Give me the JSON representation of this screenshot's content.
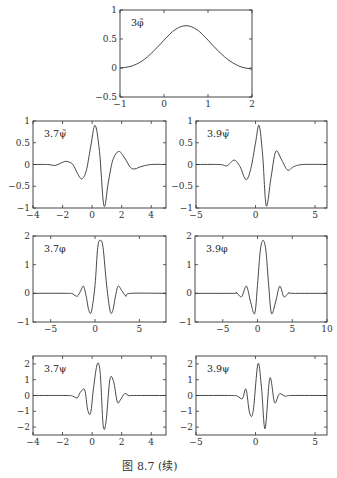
{
  "caption": "图 8.7   (续)",
  "chart_data": [
    {
      "id": "p1",
      "type": "line",
      "label": "3φ̃",
      "frame": [
        120,
        10,
        252,
        97
      ],
      "xlim": [
        -1,
        2
      ],
      "ylim": [
        -0.5,
        1
      ],
      "xticks": [
        -1,
        0,
        1,
        2
      ],
      "xticklabels": [
        "−1",
        "0",
        "1",
        "2"
      ],
      "yticks": [
        -0.5,
        0,
        0.5,
        1
      ],
      "yticklabels": [
        "−0.5",
        "0",
        "0.5",
        "1"
      ],
      "x": [
        -1,
        -0.75,
        -0.5,
        -0.25,
        0,
        0.25,
        0.5,
        0.75,
        1,
        1.25,
        1.5,
        1.75,
        2
      ],
      "y": [
        0,
        0.03,
        0.12,
        0.28,
        0.48,
        0.66,
        0.73,
        0.66,
        0.48,
        0.28,
        0.12,
        0.02,
        -0.02
      ]
    },
    {
      "id": "p2",
      "type": "line",
      "label": "3.7ψ̃",
      "frame": [
        33,
        121,
        166,
        208
      ],
      "xlim": [
        -4,
        5
      ],
      "ylim": [
        -1,
        1
      ],
      "xticks": [
        -4,
        -2,
        0,
        2,
        4
      ],
      "xticklabels": [
        "−4",
        "−2",
        "0",
        "2",
        "4"
      ],
      "yticks": [
        -1,
        -0.5,
        0,
        0.5,
        1
      ],
      "yticklabels": [
        "−1",
        "−0.5",
        "0",
        "0.5",
        "1"
      ],
      "x": [
        -4,
        -3,
        -2.5,
        -2,
        -1.7,
        -1.3,
        -1,
        -0.7,
        -0.4,
        -0.1,
        0.2,
        0.5,
        0.8,
        1.1,
        1.4,
        1.8,
        2.2,
        2.6,
        2.9,
        3.3,
        4,
        5
      ],
      "y": [
        0,
        0,
        -0.02,
        0.05,
        0.07,
        0.0,
        -0.2,
        -0.33,
        -0.15,
        0.4,
        0.9,
        0.3,
        -0.95,
        -0.4,
        0.1,
        0.3,
        0.15,
        -0.07,
        -0.1,
        -0.05,
        0,
        0
      ]
    },
    {
      "id": "p3",
      "type": "line",
      "label": "3.9ψ̃",
      "frame": [
        196,
        121,
        327,
        208
      ],
      "xlim": [
        -5,
        6
      ],
      "ylim": [
        -1,
        1
      ],
      "xticks": [
        -5,
        0,
        5
      ],
      "xticklabels": [
        "−5",
        "0",
        "5"
      ],
      "yticks": [
        -1,
        -0.5,
        0,
        0.5,
        1
      ],
      "yticklabels": [
        "−1",
        "−0.5",
        "0",
        "0.5",
        "1"
      ],
      "x": [
        -5,
        -3,
        -2.4,
        -1.8,
        -1.3,
        -0.8,
        -0.4,
        0,
        0.3,
        0.6,
        0.9,
        1.3,
        1.7,
        2.2,
        2.7,
        3.2,
        4,
        6
      ],
      "y": [
        0,
        0,
        -0.03,
        0.1,
        -0.05,
        -0.35,
        -0.1,
        0.5,
        0.9,
        0.2,
        -0.95,
        -0.3,
        0.3,
        0.1,
        -0.13,
        -0.05,
        0,
        0
      ]
    },
    {
      "id": "p4",
      "type": "line",
      "label": "3.7φ",
      "frame": [
        33,
        236,
        166,
        322
      ],
      "xlim": [
        -7,
        8
      ],
      "ylim": [
        -1,
        2
      ],
      "xticks": [
        -5,
        0,
        5
      ],
      "xticklabels": [
        "−5",
        "0",
        "5"
      ],
      "yticks": [
        -1,
        0,
        1,
        2
      ],
      "yticklabels": [
        "−1",
        "0",
        "1",
        "2"
      ],
      "x": [
        -7,
        -3,
        -2.5,
        -2,
        -1.6,
        -1.3,
        -1,
        -0.7,
        -0.4,
        0,
        0.3,
        0.6,
        0.9,
        1.3,
        1.7,
        2,
        2.3,
        2.6,
        3,
        3.5,
        4,
        8
      ],
      "y": [
        0,
        0,
        -0.03,
        -0.1,
        0.1,
        0.25,
        -0.1,
        -0.6,
        -0.62,
        0.3,
        1.6,
        1.85,
        1.6,
        0.3,
        -0.62,
        -0.6,
        -0.1,
        0.25,
        0.1,
        -0.1,
        0,
        0
      ]
    },
    {
      "id": "p5",
      "type": "line",
      "label": "3.9φ",
      "frame": [
        195,
        236,
        327,
        322
      ],
      "xlim": [
        -9,
        10
      ],
      "ylim": [
        -1,
        2
      ],
      "xticks": [
        -5,
        0,
        5,
        10
      ],
      "xticklabels": [
        "−5",
        "0",
        "5",
        "10"
      ],
      "yticks": [
        -1,
        0,
        1,
        2
      ],
      "yticklabels": [
        "−1",
        "0",
        "1",
        "2"
      ],
      "x": [
        -9,
        -3.5,
        -3,
        -2.3,
        -1.6,
        -1,
        -0.4,
        0,
        0.4,
        0.8,
        1.2,
        1.6,
        2.0,
        2.6,
        3.2,
        3.8,
        4.5,
        5,
        10
      ],
      "y": [
        0,
        0,
        0.02,
        -0.12,
        0.25,
        -0.3,
        -0.7,
        0.3,
        1.5,
        1.85,
        1.5,
        0.3,
        -0.7,
        -0.3,
        0.25,
        -0.12,
        0.02,
        0,
        0
      ]
    },
    {
      "id": "p6",
      "type": "line",
      "label": "3.7ψ",
      "frame": [
        33,
        356,
        166,
        435
      ],
      "xlim": [
        -4,
        5
      ],
      "ylim": [
        -2.5,
        2.5
      ],
      "xticks": [
        -4,
        -2,
        0,
        2,
        4
      ],
      "xticklabels": [
        "−4",
        "−2",
        "0",
        "2",
        "4"
      ],
      "yticks": [
        -2,
        -1,
        0,
        1,
        2
      ],
      "yticklabels": [
        "−2",
        "−1",
        "0",
        "1",
        "2"
      ],
      "x": [
        -4,
        -1.7,
        -1.3,
        -1,
        -0.8,
        -0.5,
        -0.3,
        -0.1,
        0.1,
        0.35,
        0.55,
        0.75,
        0.95,
        1.2,
        1.45,
        1.7,
        1.9,
        2.2,
        2.5,
        2.8,
        5
      ],
      "y": [
        0,
        0,
        -0.05,
        -0.15,
        0.2,
        0.35,
        -0.9,
        -1.1,
        0.5,
        2.0,
        1.4,
        -1.9,
        -1.6,
        1.0,
        0.9,
        -0.4,
        -0.3,
        0.12,
        -0.02,
        0,
        0
      ]
    },
    {
      "id": "p7",
      "type": "line",
      "label": "3.9ψ",
      "frame": [
        196,
        356,
        327,
        435
      ],
      "xlim": [
        -5,
        6
      ],
      "ylim": [
        -2.5,
        2.5
      ],
      "xticks": [
        -5,
        0,
        5
      ],
      "xticklabels": [
        "−5",
        "0",
        "5"
      ],
      "yticks": [
        -2,
        -1,
        0,
        1,
        2
      ],
      "yticklabels": [
        "−2",
        "−1",
        "0",
        "1",
        "2"
      ],
      "x": [
        -5,
        -2,
        -1.5,
        -1.1,
        -0.8,
        -0.5,
        -0.2,
        0.2,
        0.5,
        0.8,
        1.2,
        1.6,
        2.0,
        2.5,
        3,
        6
      ],
      "y": [
        0,
        0,
        -0.05,
        -0.2,
        0.4,
        -1.1,
        -1.0,
        2.0,
        0.5,
        -2.1,
        1.1,
        -0.45,
        0.1,
        -0.05,
        0,
        0
      ]
    }
  ]
}
